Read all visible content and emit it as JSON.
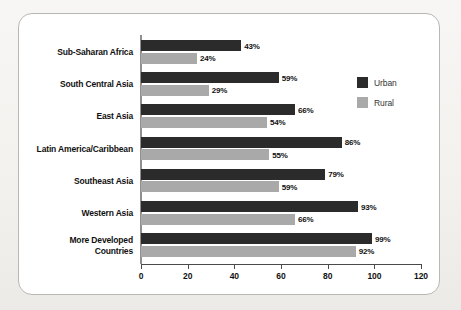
{
  "chart_data": {
    "type": "bar",
    "orientation": "horizontal",
    "title": "",
    "subtitle": "",
    "xlabel": "",
    "ylabel": "",
    "xlim": [
      0,
      120
    ],
    "xticks": [
      0,
      20,
      40,
      60,
      80,
      100,
      120
    ],
    "xtick_labels": [
      "0",
      "20",
      "40",
      "60",
      "80",
      "100",
      "120"
    ],
    "grid": false,
    "legend_position": "right",
    "value_suffix": "%",
    "categories": [
      "Sub-Saharan Africa",
      "South Central Asia",
      "East Asia",
      "Latin America/Caribbean",
      "Southeast Asia",
      "Western Asia",
      "More Developed\nCountries"
    ],
    "series": [
      {
        "name": "Urban",
        "color": "#2b2b2b",
        "values": [
          43,
          59,
          66,
          86,
          79,
          93,
          99
        ],
        "labels": [
          "43%",
          "59%",
          "66%",
          "86%",
          "79%",
          "93%",
          "99%"
        ]
      },
      {
        "name": "Rural",
        "color": "#a9a9a9",
        "values": [
          24,
          29,
          54,
          55,
          59,
          66,
          92
        ],
        "labels": [
          "24%",
          "29%",
          "54%",
          "55%",
          "59%",
          "66%",
          "92%"
        ]
      }
    ]
  },
  "legend": {
    "items": [
      {
        "label": "Urban",
        "color": "#2b2b2b"
      },
      {
        "label": "Rural",
        "color": "#a9a9a9"
      }
    ]
  },
  "axis": {
    "ticks": [
      {
        "label": "0",
        "value": 0
      },
      {
        "label": "20",
        "value": 20
      },
      {
        "label": "40",
        "value": 40
      },
      {
        "label": "60",
        "value": 60
      },
      {
        "label": "80",
        "value": 80
      },
      {
        "label": "100",
        "value": 100
      },
      {
        "label": "120",
        "value": 120
      }
    ]
  },
  "colors": {
    "urban": "#2b2b2b",
    "rural": "#a9a9a9",
    "card_background": "#ffffff",
    "page_background": "#f2f1ee",
    "border": "#b9b7b4",
    "text": "#111111"
  }
}
